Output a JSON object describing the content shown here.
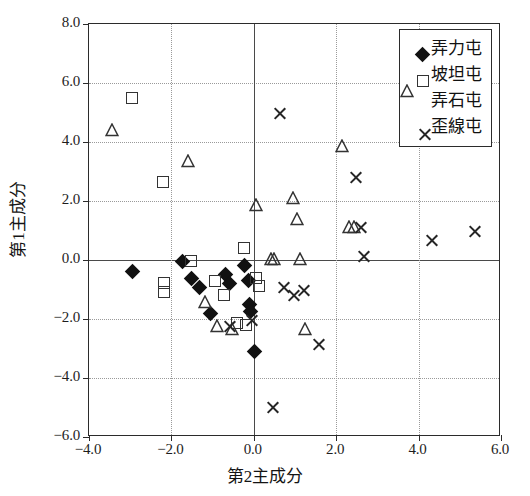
{
  "chart_data": {
    "type": "scatter",
    "title": "",
    "xlabel": "第2主成分",
    "ylabel": "第1主成分",
    "xlim": [
      -4.0,
      6.0
    ],
    "ylim": [
      -6.0,
      8.0
    ],
    "xticks": [
      "-4.0",
      "-2.0",
      "0.0",
      "2.0",
      "4.0",
      "6.0"
    ],
    "xtick_values": [
      -4.0,
      -2.0,
      0.0,
      2.0,
      4.0,
      6.0
    ],
    "yticks": [
      "8.0",
      "6.0",
      "4.0",
      "2.0",
      "0.0",
      "-2.0",
      "-4.0",
      "-6.0"
    ],
    "ytick_values": [
      8.0,
      6.0,
      4.0,
      2.0,
      0.0,
      -2.0,
      -4.0,
      -6.0
    ],
    "grid": true,
    "legend_position": "top-right",
    "series": [
      {
        "name": "弄力屯",
        "marker": "diamond",
        "color": "#111111",
        "points": [
          [
            -2.95,
            -0.4
          ],
          [
            -1.72,
            -0.04
          ],
          [
            -1.52,
            -0.62
          ],
          [
            -1.32,
            -0.92
          ],
          [
            -1.05,
            -1.82
          ],
          [
            -0.68,
            -0.5
          ],
          [
            -0.58,
            -0.78
          ],
          [
            -0.22,
            -0.18
          ],
          [
            -0.12,
            -0.7
          ],
          [
            -0.1,
            -1.52
          ],
          [
            -0.08,
            -1.75
          ],
          [
            0.02,
            -3.1
          ]
        ]
      },
      {
        "name": "坡坦屯",
        "marker": "square",
        "color": "#333333",
        "points": [
          [
            -2.95,
            5.5
          ],
          [
            -2.2,
            2.65
          ],
          [
            -2.18,
            -0.78
          ],
          [
            -2.18,
            -1.08
          ],
          [
            -1.52,
            -0.05
          ],
          [
            -0.95,
            -0.72
          ],
          [
            -0.72,
            -1.18
          ],
          [
            -0.4,
            -2.12
          ],
          [
            -0.25,
            0.4
          ],
          [
            -0.18,
            -2.22
          ],
          [
            0.05,
            -0.62
          ],
          [
            0.12,
            -0.88
          ]
        ]
      },
      {
        "name": "弄石屯",
        "marker": "triangle",
        "color": "#333333",
        "points": [
          [
            -3.45,
            4.4
          ],
          [
            -1.6,
            3.35
          ],
          [
            -1.18,
            -1.42
          ],
          [
            -0.9,
            -2.25
          ],
          [
            -0.52,
            -2.35
          ],
          [
            0.05,
            1.85
          ],
          [
            0.42,
            0.02
          ],
          [
            0.5,
            0.05
          ],
          [
            0.95,
            2.1
          ],
          [
            1.05,
            1.4
          ],
          [
            1.12,
            0.02
          ],
          [
            1.25,
            -2.35
          ],
          [
            2.15,
            3.85
          ],
          [
            2.3,
            1.12
          ],
          [
            2.42,
            1.12
          ]
        ]
      },
      {
        "name": "歪線屯",
        "marker": "cross",
        "color": "#262626",
        "points": [
          [
            -0.6,
            -2.25
          ],
          [
            -0.08,
            -2.05
          ],
          [
            0.45,
            -5.0
          ],
          [
            0.6,
            4.95
          ],
          [
            0.72,
            -0.92
          ],
          [
            0.95,
            -1.22
          ],
          [
            1.2,
            -1.02
          ],
          [
            1.55,
            -2.85
          ],
          [
            2.45,
            2.8
          ],
          [
            2.58,
            1.1
          ],
          [
            2.65,
            0.12
          ],
          [
            4.3,
            0.65
          ],
          [
            5.35,
            0.95
          ]
        ]
      }
    ]
  },
  "legend": {
    "entries": [
      {
        "label": "弄力屯",
        "marker": "diamond"
      },
      {
        "label": "坡坦屯",
        "marker": "square"
      },
      {
        "label": "弄石屯",
        "marker": "triangle"
      },
      {
        "label": "歪線屯",
        "marker": "cross"
      }
    ]
  }
}
